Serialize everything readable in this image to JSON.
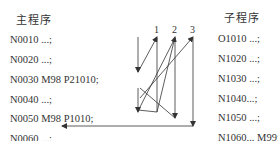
{
  "main_program": {
    "title": "主程序",
    "lines": [
      "N0010 ...;",
      "N0020 ...;",
      "N0030 M98 P21010;",
      "N0040 ...;",
      "N0050 M98 P1010;",
      "N0060 ...;"
    ]
  },
  "subprogram": {
    "title": "子程序",
    "lines": [
      "O1010 ...;",
      "N1020 ...;",
      "N1030 ...;",
      "N1040...;",
      "N1050 ...;",
      "N1060... M99;"
    ]
  },
  "call_markers": [
    "1",
    "2",
    "3"
  ],
  "colors": {
    "line": "#333333",
    "text": "#333333",
    "background": "#ffffff"
  }
}
